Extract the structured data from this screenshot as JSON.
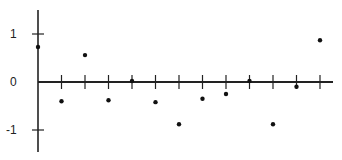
{
  "chart_data": {
    "type": "scatter",
    "title": "",
    "xlabel": "",
    "ylabel": "",
    "x": [
      0,
      1,
      2,
      3,
      4,
      5,
      6,
      7,
      8,
      9,
      10,
      11,
      12
    ],
    "values": [
      0.73,
      -0.4,
      0.56,
      -0.38,
      0.02,
      -0.42,
      -0.88,
      -0.35,
      -0.25,
      0.02,
      -0.88,
      -0.1,
      0.87
    ],
    "y_ticks": [
      1,
      0,
      -1
    ],
    "y_tick_labels": [
      "1",
      "0",
      "-1"
    ],
    "ylim": [
      -1.5,
      1.5
    ],
    "xlim": [
      0,
      12.5
    ],
    "grid": false,
    "legend": null
  },
  "colors": {
    "axis": "#222222",
    "points": "#111111",
    "background": "#ffffff"
  }
}
